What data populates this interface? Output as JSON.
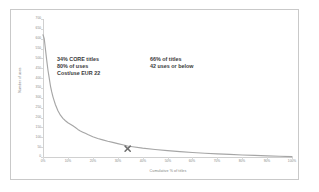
{
  "chart_data": {
    "type": "line",
    "title": "",
    "subtitle": "",
    "xlabel": "Cumulative % of titles",
    "ylabel": "Number of uses",
    "xlim": [
      0,
      100
    ],
    "ylim": [
      0,
      700
    ],
    "grid": false,
    "legend": null,
    "line_color": "#a6a6a6",
    "x_tick_labels": [
      "0%",
      "10%",
      "20%",
      "30%",
      "40%",
      "50%",
      "60%",
      "70%",
      "80%",
      "90%",
      "100%"
    ],
    "x_tick_values": [
      0,
      10,
      20,
      30,
      40,
      50,
      60,
      70,
      80,
      90,
      100
    ],
    "y_tick_labels": [
      "700",
      "650",
      "600",
      "550",
      "500",
      "450",
      "400",
      "350",
      "300",
      "250",
      "200",
      "150",
      "100",
      "50",
      "0"
    ],
    "y_tick_values": [
      700,
      650,
      600,
      550,
      500,
      450,
      400,
      350,
      300,
      250,
      200,
      150,
      100,
      50,
      0
    ],
    "series": [
      {
        "name": "Uses per title (rank ordered)",
        "x": [
          0.0,
          0.5,
          1.0,
          1.5,
          2.0,
          2.5,
          3.0,
          3.5,
          4.0,
          4.5,
          5.0,
          6.0,
          7.0,
          8.0,
          9.0,
          10.0,
          11.0,
          12.0,
          13.0,
          14.0,
          15.0,
          16.0,
          17.0,
          18.0,
          20.0,
          22.0,
          24.0,
          26.0,
          28.0,
          30.0,
          32.0,
          34.0,
          36.0,
          40.0,
          45.0,
          50.0,
          55.0,
          60.0,
          65.0,
          70.0,
          75.0,
          80.0,
          85.0,
          90.0,
          95.0,
          100.0
        ],
        "y": [
          620,
          600,
          545,
          490,
          440,
          400,
          360,
          330,
          305,
          285,
          265,
          235,
          212,
          196,
          184,
          174,
          166,
          158,
          150,
          140,
          132,
          126,
          120,
          114,
          103,
          94,
          87,
          80,
          74,
          68,
          62,
          56,
          52,
          45,
          38,
          32,
          27,
          23,
          19,
          16,
          13,
          10,
          8,
          6,
          4,
          2
        ]
      }
    ],
    "markers": [
      {
        "label": "X",
        "shape": "x-cross",
        "x": 34,
        "y": 42,
        "color": "#6e6e6e"
      }
    ],
    "annotations": [
      {
        "name": "core-titles-callout",
        "lines": [
          "34% CORE titles",
          "80% of uses",
          "Cost/use EUR 22"
        ]
      },
      {
        "name": "low-use-titles-callout",
        "lines": [
          "66% of titles",
          "42 uses or below"
        ]
      }
    ]
  }
}
